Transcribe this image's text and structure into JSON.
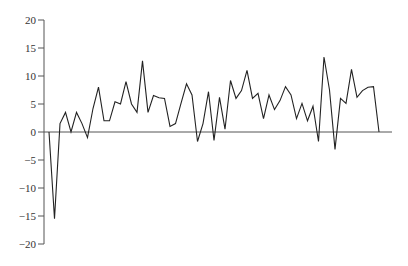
{
  "chart_data": {
    "type": "line",
    "title": "",
    "xlabel": "",
    "ylabel": "",
    "ylim": [
      -20,
      20
    ],
    "yticks": [
      20,
      15,
      10,
      5,
      0,
      -5,
      -10,
      -15,
      -20
    ],
    "ytick_labels": [
      "20",
      "15",
      "10",
      "5",
      "0",
      "−5",
      "−10",
      "−15",
      "−20"
    ],
    "grid": false,
    "legend": null,
    "x": [
      0,
      1,
      2,
      3,
      4,
      5,
      6,
      7,
      8,
      9,
      10,
      11,
      12,
      13,
      14,
      15,
      16,
      17,
      18,
      19,
      20,
      21,
      22,
      23,
      24,
      25,
      26,
      27,
      28,
      29,
      30,
      31,
      32,
      33,
      34,
      35,
      36,
      37,
      38,
      39,
      40,
      41,
      42,
      43,
      44,
      45,
      46,
      47,
      48,
      49,
      50,
      51,
      52,
      53,
      54,
      55,
      56,
      57,
      58,
      59,
      60
    ],
    "series": [
      {
        "name": "series",
        "color": "#222222",
        "values": [
          0,
          -15.5,
          1.5,
          3.5,
          0,
          3.5,
          1.5,
          -1,
          4.2,
          8,
          2,
          2,
          5.4,
          5,
          9,
          5,
          3.5,
          12.7,
          3.5,
          6.5,
          6.1,
          6,
          1,
          1.5,
          5.1,
          8.6,
          6.6,
          -1.7,
          1.5,
          7.2,
          -1.5,
          6.2,
          0.5,
          9.2,
          6,
          7.4,
          11,
          6,
          6.9,
          2.4,
          6.6,
          4,
          5.6,
          8.1,
          6.6,
          2.4,
          5.1,
          2,
          4.6,
          -1.7,
          13.4,
          7.5,
          -3.1,
          6,
          5.1,
          11.2,
          6.2,
          7.4,
          8,
          8.1,
          0
        ]
      }
    ],
    "colors": {
      "axis": "#555555",
      "line": "#222222",
      "background": "#ffffff"
    }
  }
}
